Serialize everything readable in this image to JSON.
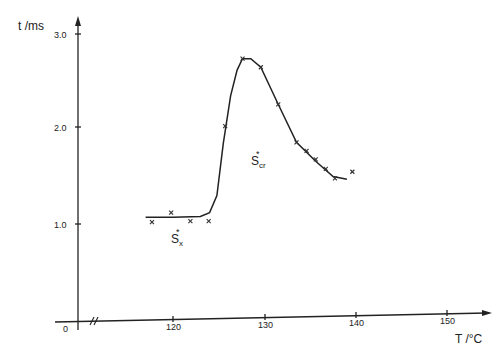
{
  "chart_data": {
    "type": "scatter",
    "title": "",
    "xlabel": "T /°C",
    "ylabel": "t /ms",
    "x_ticks": [
      "0",
      "120",
      "130",
      "140",
      "150"
    ],
    "y_ticks": [
      "1.0",
      "2.0",
      "3.0"
    ],
    "x_axis_break": true,
    "xlim": [
      115,
      155
    ],
    "ylim": [
      0,
      3.2
    ],
    "grid": false,
    "legend": null,
    "series": [
      {
        "name": "measured",
        "marker": "x",
        "x": [
          117.7,
          119.8,
          121.9,
          123.9,
          125.7,
          127.6,
          129.6,
          131.5,
          133.5,
          134.6,
          135.6,
          136.7,
          137.7,
          139.6
        ],
        "y": [
          1.02,
          1.12,
          1.03,
          1.03,
          2.03,
          2.74,
          2.65,
          2.26,
          1.86,
          1.77,
          1.68,
          1.58,
          1.48,
          1.55
        ]
      },
      {
        "name": "fitted curve",
        "marker": "none",
        "x": [
          117.0,
          120.0,
          123.0,
          124.0,
          124.8,
          125.5,
          126.3,
          127.0,
          127.6,
          128.5,
          129.6,
          131.5,
          133.5,
          135.6,
          137.5,
          139.0
        ],
        "y": [
          1.07,
          1.07,
          1.08,
          1.12,
          1.3,
          1.85,
          2.35,
          2.62,
          2.74,
          2.74,
          2.65,
          2.26,
          1.86,
          1.66,
          1.5,
          1.47
        ]
      }
    ],
    "annotations": [
      {
        "text": "S*x",
        "main": "S",
        "sup": "*",
        "sub": "x",
        "x": 120.2,
        "y": 0.82
      },
      {
        "text": "S*cr",
        "main": "S",
        "sup": "*",
        "sub": "cr",
        "x": 130.0,
        "y": 1.65
      }
    ]
  }
}
